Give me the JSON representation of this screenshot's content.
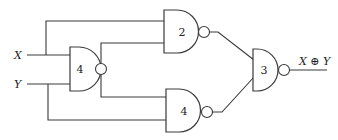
{
  "diagram": {
    "type": "logic-circuit",
    "inputs": [
      {
        "id": "X",
        "label": "X"
      },
      {
        "id": "Y",
        "label": "Y"
      }
    ],
    "gates": [
      {
        "id": "gate-input",
        "kind": "NAND",
        "label": "4",
        "inputs": [
          "X",
          "Y"
        ]
      },
      {
        "id": "gate-top",
        "kind": "NAND",
        "label": "2",
        "inputs": [
          "X",
          "gate-input"
        ]
      },
      {
        "id": "gate-bottom",
        "kind": "NAND",
        "label": "4",
        "inputs": [
          "gate-input",
          "Y"
        ]
      },
      {
        "id": "gate-output",
        "kind": "NAND",
        "label": "3",
        "inputs": [
          "gate-top",
          "gate-bottom"
        ]
      }
    ],
    "output": {
      "from": "gate-output",
      "label": "X ⊕ Y"
    }
  }
}
